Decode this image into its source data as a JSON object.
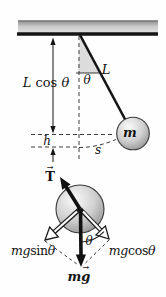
{
  "figure": {
    "labels": {
      "lcos": {
        "var1": "L",
        "fn": "cos",
        "var2": "θ"
      },
      "theta_top": "θ",
      "length": "L",
      "mass": "m",
      "height": "h",
      "arc": "s",
      "tension": "T",
      "vec_arrow": "→",
      "mgsin": {
        "var1": "mg",
        "fn": "sin",
        "var2": "θ"
      },
      "theta_fbd": "θ",
      "mgcos": {
        "var1": "mg",
        "fn": "cos",
        "var2": "θ"
      },
      "weight": {
        "m": "m",
        "g": "g"
      }
    },
    "colors": {
      "ink": "#151515",
      "dash": "#3c3c3c",
      "ceiling_top": "#8f8f8f",
      "ceiling_mid": "#c9c9c9",
      "ceiling_bottom": "#e2e2e2",
      "wedge_fill": "#dcdcdc",
      "sphere_highlight": "#fafafa",
      "sphere_mid": "#cfcfcf",
      "sphere_edge": "#8e8e8e"
    }
  }
}
